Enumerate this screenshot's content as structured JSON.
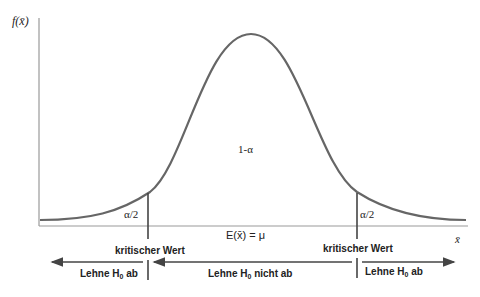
{
  "diagram": {
    "y_axis_label": "f(x̄)",
    "x_axis_label": "x̄",
    "center_area": "1-α",
    "left_tail": "α/2",
    "right_tail": "α/2",
    "expected_value": "E(x̄) = μ",
    "left_critical": "kritischer Wert",
    "right_critical": "kritischer Wert",
    "regions": {
      "left": {
        "text": "Lehne H",
        "sub": "0",
        "suffix": " ab"
      },
      "middle": {
        "text": "Lehne H",
        "sub": "0",
        "suffix": " nicht ab"
      },
      "right": {
        "text": "Lehne H",
        "sub": "0",
        "suffix": " ab"
      }
    },
    "colors": {
      "curve": "#666666",
      "axis": "#999999",
      "arrow": "#444444"
    }
  }
}
